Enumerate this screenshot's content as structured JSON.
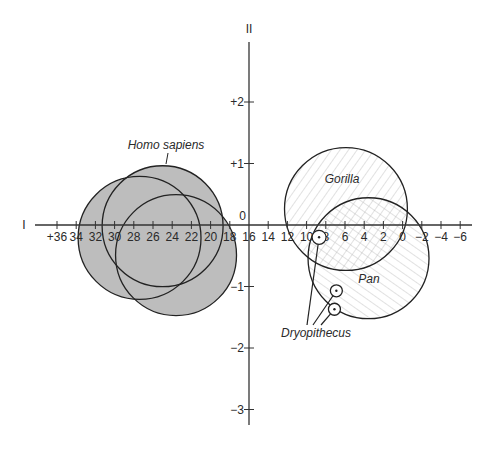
{
  "chart_data": {
    "type": "scatter",
    "title": "",
    "xlabel": "I",
    "ylabel": "II",
    "xlim": [
      37.5,
      -7.5
    ],
    "ylim": [
      -3.3,
      3.0
    ],
    "x_direction": "reversed",
    "grid": false,
    "x_ticks": [
      36,
      34,
      32,
      30,
      28,
      26,
      24,
      22,
      20,
      18,
      16,
      14,
      12,
      10,
      8,
      6,
      4,
      2,
      0,
      -2,
      -4,
      -6
    ],
    "x_tick_labels": [
      "+36",
      "34",
      "32",
      "30",
      "28",
      "26",
      "24",
      "22",
      "20",
      "18",
      "16",
      "14",
      "12",
      "10",
      "8",
      "6",
      "4",
      "2",
      "0",
      "−2",
      "−4",
      "−6"
    ],
    "y_ticks": [
      2,
      1,
      -1,
      -2,
      -3
    ],
    "y_tick_labels": [
      "+2",
      "+1",
      "−1",
      "−2",
      "−3"
    ],
    "origin_label": "0",
    "groups": [
      {
        "name": "Homo sapiens",
        "fill": "#bdbdbd",
        "pattern": "solid",
        "regions": [
          {
            "cx": 27.4,
            "cy": -0.21,
            "r": 6.4
          },
          {
            "cx": 25.0,
            "cy": -0.02,
            "r": 6.3
          },
          {
            "cx": 23.6,
            "cy": -0.49,
            "r": 6.3
          }
        ]
      },
      {
        "name": "Gorilla",
        "fill": "#ffffff",
        "pattern": "diagonal-hatch",
        "regions": [
          {
            "cx": 5.9,
            "cy": 0.26,
            "r": 6.4
          }
        ]
      },
      {
        "name": "Pan",
        "fill": "#ffffff",
        "pattern": "reverse-diagonal-hatch",
        "regions": [
          {
            "cx": 3.55,
            "cy": -0.54,
            "r": 6.3
          }
        ]
      }
    ],
    "points": [
      {
        "name": "Dryopithecus",
        "x": 8.7,
        "y": -0.2
      },
      {
        "name": "Dryopithecus",
        "x": 6.9,
        "y": -1.07
      },
      {
        "name": "Dryopithecus",
        "x": 7.1,
        "y": -1.37
      }
    ],
    "annotations": [
      "Homo sapiens",
      "Gorilla",
      "Pan",
      "Dryopithecus"
    ]
  }
}
